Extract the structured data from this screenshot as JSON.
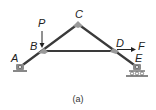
{
  "figure": {
    "caption": "(a)",
    "colors": {
      "member": "#3a3a3a",
      "joint": "#9a9a9a",
      "support": "#8c8c8c",
      "ground": "#555555",
      "arrow": "#222222",
      "text": "#222222"
    },
    "joints": {
      "A": {
        "label": "A",
        "x": 20,
        "y": 67
      },
      "B": {
        "label": "B",
        "x": 42,
        "y": 51
      },
      "C": {
        "label": "C",
        "x": 78,
        "y": 24
      },
      "D": {
        "label": "D",
        "x": 115,
        "y": 51
      },
      "E": {
        "label": "E",
        "x": 137,
        "y": 67
      }
    },
    "members": [
      {
        "from": "A",
        "to": "C"
      },
      {
        "from": "C",
        "to": "E"
      },
      {
        "from": "B",
        "to": "D"
      }
    ],
    "supports": [
      {
        "joint": "A",
        "type": "pin"
      },
      {
        "joint": "E",
        "type": "roller"
      }
    ],
    "loads": [
      {
        "label": "P",
        "joint": "B",
        "direction": "down"
      },
      {
        "label": "F",
        "joint": "D",
        "direction": "right"
      }
    ]
  }
}
